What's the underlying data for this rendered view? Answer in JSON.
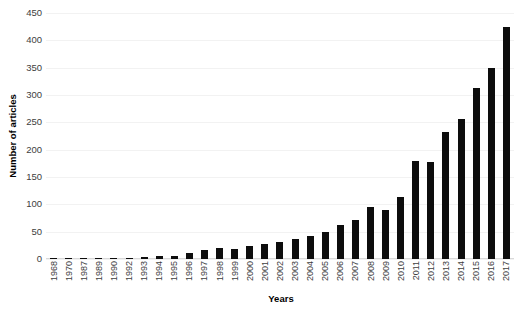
{
  "chart_data": {
    "type": "bar",
    "title": "",
    "xlabel": "Years",
    "ylabel": "Number of articles",
    "ylim": [
      0,
      450
    ],
    "ytick_step": 50,
    "yticks": [
      450,
      400,
      350,
      300,
      250,
      200,
      150,
      100,
      50,
      0
    ],
    "grid": true,
    "legend": false,
    "bar_color": "#0d0d0d",
    "gridline_color": "#f2f2f2",
    "tick_label_color": "#404040",
    "categories": [
      "1968",
      "1970",
      "1987",
      "1989",
      "1990",
      "1992",
      "1993",
      "1994",
      "1995",
      "1996",
      "1997",
      "1998",
      "1999",
      "2000",
      "2001",
      "2002",
      "2003",
      "2004",
      "2005",
      "2006",
      "2007",
      "2008",
      "2009",
      "2010",
      "2011",
      "2012",
      "2013",
      "2014",
      "2015",
      "2016",
      "2017"
    ],
    "values": [
      1,
      1,
      1,
      1,
      1,
      2,
      4,
      6,
      5,
      11,
      17,
      21,
      18,
      24,
      27,
      31,
      36,
      42,
      50,
      62,
      72,
      95,
      90,
      113,
      180,
      177,
      233,
      256,
      313,
      350,
      425
    ]
  }
}
